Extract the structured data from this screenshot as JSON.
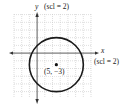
{
  "diagram": {
    "type": "circle-on-coordinate-grid",
    "y_axis": {
      "name": "y",
      "scale_label": "(scl = 2)"
    },
    "x_axis": {
      "name": "x",
      "scale_label": "(scl = 2)"
    },
    "circle": {
      "center_label": "(5, −3)",
      "center": [
        5,
        -3
      ],
      "radius": 7
    },
    "colors": {
      "grid": "#c8c8c8",
      "axes": "#333333",
      "circle": "#1a1a1a"
    }
  }
}
